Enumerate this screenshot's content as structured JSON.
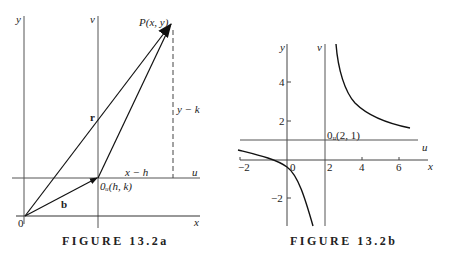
{
  "figure_a": {
    "caption": "FIGURE 13.2a",
    "labels": {
      "y_axis": "y",
      "v_axis": "v",
      "x_axis": "x",
      "u_axis": "u",
      "origin": "0",
      "point_p": "P(x, y)",
      "origin_shifted": "0ᵤ(h, k)",
      "vector_r": "r",
      "vector_b": "b",
      "dx": "x − h",
      "dy": "y − k"
    }
  },
  "figure_b": {
    "caption": "FIGURE 13.2b",
    "labels": {
      "y_axis": "y",
      "v_axis": "v",
      "x_axis": "x",
      "u_axis": "u",
      "origin_shifted": "0ᵤ(2, 1)"
    },
    "x_ticks": [
      "−2",
      "0",
      "2",
      "4",
      "6"
    ],
    "y_ticks": [
      "4",
      "2",
      "−2"
    ]
  },
  "colors": {
    "ink": "#222222",
    "axis": "#555555",
    "background": "#ffffff"
  }
}
